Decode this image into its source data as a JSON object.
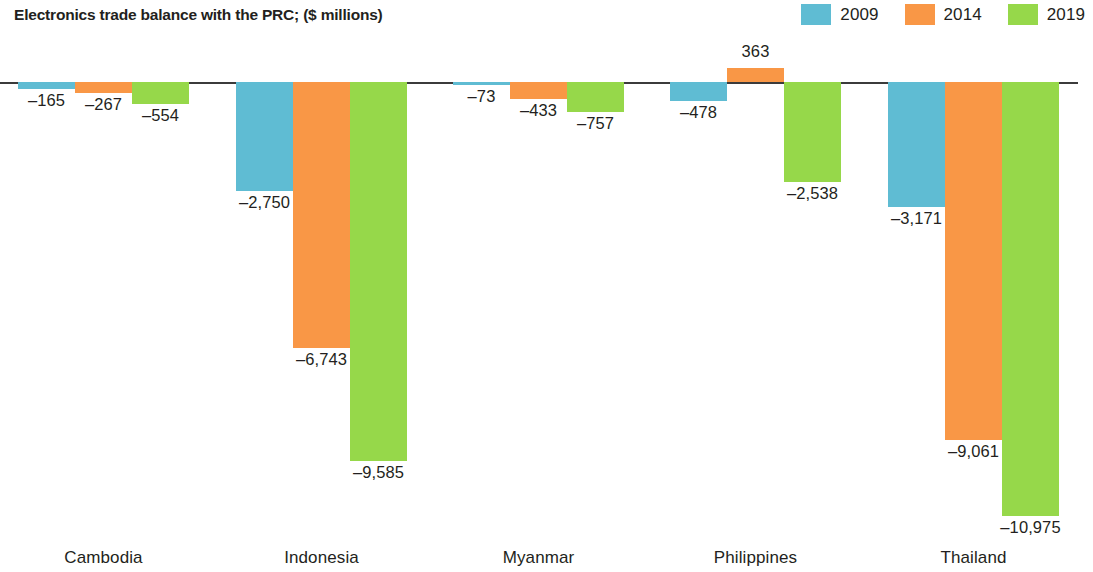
{
  "header": {
    "title": "Electronics trade balance with the PRC; ($ millions)"
  },
  "legend": {
    "position": "top-right",
    "entries": [
      {
        "label": "2009",
        "color": "#5FBCD3"
      },
      {
        "label": "2014",
        "color": "#F99746"
      },
      {
        "label": "2019",
        "color": "#96D84A"
      }
    ]
  },
  "axis": {
    "baseline_value": "0"
  },
  "chart_data": {
    "type": "bar",
    "title": "Electronics trade balance with the PRC; ($ millions)",
    "xlabel": "",
    "ylabel": "$ millions",
    "grid": false,
    "legend_position": "top-right",
    "categories": [
      "Cambodia",
      "Indonesia",
      "Myanmar",
      "Philippines",
      "Thailand"
    ],
    "ylim": [
      -11500,
      1000
    ],
    "series": [
      {
        "name": "2009",
        "color": "#5FBCD3",
        "values": [
          -165,
          -2750,
          -73,
          -478,
          -3171
        ],
        "labels": [
          "–165",
          "–2,750",
          "–73",
          "–478",
          "–3,171"
        ]
      },
      {
        "name": "2014",
        "color": "#F99746",
        "values": [
          -267,
          -6743,
          -433,
          363,
          -9061
        ],
        "labels": [
          "–267",
          "–6,743",
          "–433",
          "363",
          "–9,061"
        ]
      },
      {
        "name": "2019",
        "color": "#96D84A",
        "values": [
          -554,
          -9585,
          -757,
          -2538,
          -10975
        ],
        "labels": [
          "–554",
          "–9,585",
          "–757",
          "–2,538",
          "–10,975"
        ]
      }
    ]
  },
  "layout": {
    "baseline_y": 82,
    "px_per_unit": 0.0395,
    "bar_width": 57,
    "group_starts": [
      18,
      236,
      453,
      670,
      888
    ],
    "category_label_y": 548
  }
}
